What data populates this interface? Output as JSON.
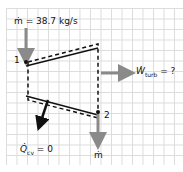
{
  "diagram": {
    "inlet_label": "ṁ = 38.7 kg/s",
    "state1_label": "1",
    "state2_label": "2",
    "work_label_sym": "Ẇ",
    "work_label_sub": "turb",
    "work_label_rest": " = ?",
    "heat_label_sym": "Q̇",
    "heat_label_sub": "cv",
    "heat_label_rest": " = 0",
    "outlet_label": "ṁ",
    "colors": {
      "flow_arrow": "#8a8a8a",
      "line": "#111111",
      "grid": "#dcdcdc"
    }
  }
}
